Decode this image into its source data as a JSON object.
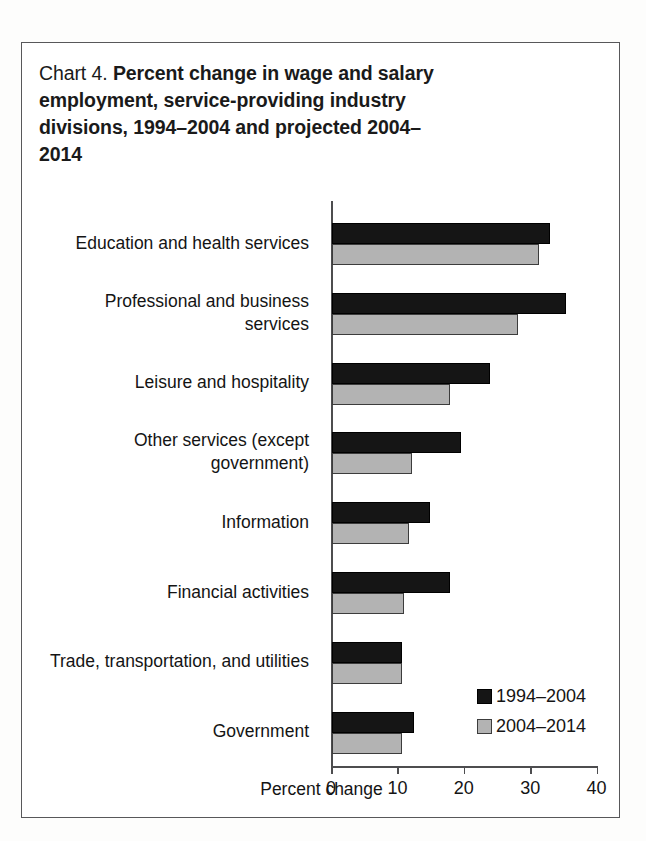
{
  "figure": {
    "title_prefix": "Chart 4.",
    "title_main": "Percent change in wage and salary employment, service-providing industry divisions, 1994–2004 and projected 2004–2014"
  },
  "legend": {
    "position": "inside-bottom-right",
    "entries": [
      {
        "label": "1994–2004",
        "color": "#151515"
      },
      {
        "label": "2004–2014",
        "color": "#b3b3b3"
      }
    ]
  },
  "axis": {
    "x_title": "Percent change",
    "x_ticks": [
      "0",
      "10",
      "20",
      "30",
      "40"
    ]
  },
  "chart_data": {
    "type": "bar",
    "orientation": "horizontal",
    "title": "Chart 4. Percent change in wage and salary employment, service-providing industry divisions, 1994–2004 and projected 2004–2014",
    "xlabel": "Percent change",
    "ylabel": "",
    "xlim": [
      0,
      40
    ],
    "xticks": [
      0,
      10,
      20,
      30,
      40
    ],
    "grid": false,
    "legend_position": "inside-bottom-right",
    "categories": [
      "Education and health services",
      "Professional and business services",
      "Leisure and hospitality",
      "Other services (except government)",
      "Information",
      "Financial activities",
      "Trade, transportation, and utilities",
      "Government"
    ],
    "series": [
      {
        "name": "1994–2004",
        "color": "#151515",
        "values": [
          32.9,
          35.2,
          23.8,
          19.5,
          14.8,
          17.7,
          10.6,
          12.4
        ]
      },
      {
        "name": "2004–2014",
        "color": "#b3b3b3",
        "values": [
          31.1,
          28.0,
          17.7,
          12.0,
          11.6,
          10.9,
          10.6,
          10.6
        ]
      }
    ]
  }
}
